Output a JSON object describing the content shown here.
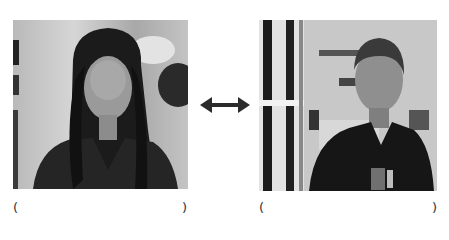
{
  "left_panel": {
    "image_description": "grayscale photo of smiling woman with long dark hair in leather jacket",
    "caption_open": "(",
    "caption_text": "",
    "caption_close": ")"
  },
  "right_panel": {
    "image_description": "grayscale photo of young man in dark polo shirt with tag, store background",
    "caption_open": "(",
    "caption_text": "",
    "caption_close": ")"
  },
  "connector": {
    "icon": "double-arrow-icon",
    "color": "#333333"
  }
}
